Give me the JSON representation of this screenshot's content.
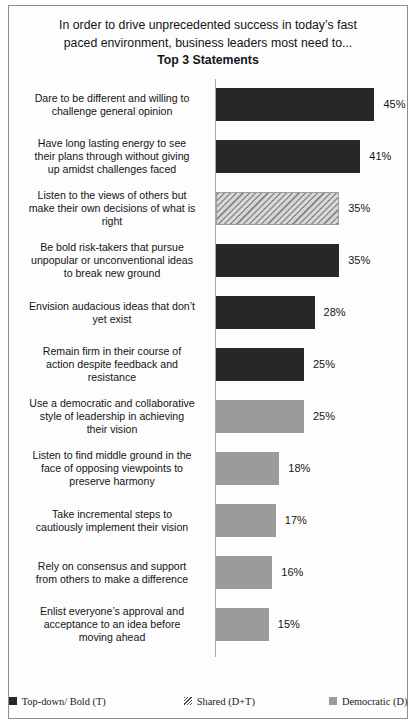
{
  "chart_data": {
    "type": "bar",
    "orientation": "horizontal",
    "title": "In order to drive unprecedented success in today’s fast paced environment, business leaders most need to...",
    "title_lines": [
      "In order to drive unprecedented success in today’s fast",
      "paced environment, business leaders most need to..."
    ],
    "subtitle": "Top 3 Statements",
    "xlabel": "",
    "ylabel": "",
    "xlim": [
      0,
      50
    ],
    "grid": false,
    "legend_position": "bottom",
    "value_suffix": "%",
    "categories": [
      "Dare to be different and willing to challenge  general opinion",
      "Have long lasting energy to see their plans through without giving up amidst challenges faced",
      "Listen to the views of others but make their own decisions of what is right",
      "Be bold risk-takers  that pursue unpopular or unconventional ideas to break new ground",
      "Envision audacious ideas that don’t yet exist",
      "Remain firm in their course of action despite feedback and resistance",
      "Use a democratic and collaborative style of leadership  in achieving their vision",
      "Listen to find middle ground in the face of opposing viewpoints  to preserve harmony",
      "Take incremental steps to cautiously implement their vision",
      "Rely on consensus and support from others to make a difference",
      "Enlist everyone’s approval and acceptance to an idea before moving ahead"
    ],
    "values": [
      45,
      41,
      35,
      35,
      28,
      25,
      25,
      18,
      17,
      16,
      15
    ],
    "value_labels": [
      "45%",
      "41%",
      "35%",
      "35%",
      "28%",
      "25%",
      "25%",
      "18%",
      "17%",
      "16%",
      "15%"
    ],
    "point_styles": [
      "topdown",
      "topdown",
      "shared",
      "topdown",
      "topdown",
      "topdown",
      "democratic",
      "democratic",
      "democratic",
      "democratic",
      "democratic"
    ],
    "legend": [
      {
        "label": "Top-down/ Bold (T)",
        "style": "topdown",
        "color": "#272727"
      },
      {
        "label": "Shared (D+T)",
        "style": "shared",
        "color": "#9d9d9d"
      },
      {
        "label": "Democratic (D)",
        "style": "democratic",
        "color": "#9b9b9b"
      }
    ]
  },
  "bars": [
    {
      "label_lines": [
        "Dare to be different and willing to",
        "challenge  general opinion"
      ],
      "value_label": "45%",
      "value": 45,
      "style": "topdown"
    },
    {
      "label_lines": [
        "Have long lasting energy to see",
        "their plans through without giving",
        "up amidst challenges faced"
      ],
      "value_label": "41%",
      "value": 41,
      "style": "topdown"
    },
    {
      "label_lines": [
        "Listen to the views of others but",
        "make their own decisions of what is",
        "right"
      ],
      "value_label": "35%",
      "value": 35,
      "style": "shared"
    },
    {
      "label_lines": [
        "Be bold risk-takers  that pursue",
        "unpopular or unconventional ideas",
        "to break new ground"
      ],
      "value_label": "35%",
      "value": 35,
      "style": "topdown"
    },
    {
      "label_lines": [
        "Envision audacious ideas that don’t",
        "yet exist"
      ],
      "value_label": "28%",
      "value": 28,
      "style": "topdown"
    },
    {
      "label_lines": [
        "Remain firm in their course of",
        "action despite feedback and",
        "resistance"
      ],
      "value_label": "25%",
      "value": 25,
      "style": "topdown"
    },
    {
      "label_lines": [
        "Use a democratic and collaborative",
        "style of leadership  in achieving",
        "their vision"
      ],
      "value_label": "25%",
      "value": 25,
      "style": "democratic"
    },
    {
      "label_lines": [
        "Listen to find middle ground in the",
        "face of opposing viewpoints  to",
        "preserve harmony"
      ],
      "value_label": "18%",
      "value": 18,
      "style": "democratic"
    },
    {
      "label_lines": [
        "Take incremental steps to",
        "cautiously implement their vision"
      ],
      "value_label": "17%",
      "value": 17,
      "style": "democratic"
    },
    {
      "label_lines": [
        "Rely on consensus and support",
        "from others to make a difference"
      ],
      "value_label": "16%",
      "value": 16,
      "style": "democratic"
    },
    {
      "label_lines": [
        "Enlist everyone’s approval and",
        "acceptance to an idea before",
        "moving ahead"
      ],
      "value_label": "15%",
      "value": 15,
      "style": "democratic"
    }
  ],
  "scale": {
    "px_per_unit": 3.52,
    "bar_pitch_px": 52,
    "bar_height_px": 33
  }
}
